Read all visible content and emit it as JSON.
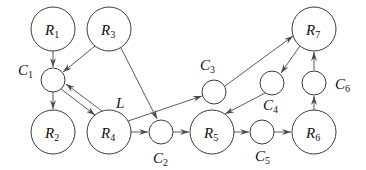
{
  "diagram": {
    "type": "directed-graph",
    "nodes": [
      {
        "id": "R1",
        "letter": "R",
        "sub": "1",
        "kind": "large",
        "x": 53,
        "y": 29
      },
      {
        "id": "R3",
        "letter": "R",
        "sub": "3",
        "kind": "large",
        "x": 109,
        "y": 29
      },
      {
        "id": "C1",
        "letter": "C",
        "sub": "1",
        "kind": "small",
        "x": 53,
        "y": 80
      },
      {
        "id": "R2",
        "letter": "R",
        "sub": "2",
        "kind": "large",
        "x": 53,
        "y": 132
      },
      {
        "id": "R4",
        "letter": "R",
        "sub": "4",
        "kind": "large",
        "x": 109,
        "y": 132
      },
      {
        "id": "C2",
        "letter": "C",
        "sub": "2",
        "kind": "small",
        "x": 161,
        "y": 132
      },
      {
        "id": "R5",
        "letter": "R",
        "sub": "5",
        "kind": "large",
        "x": 212,
        "y": 132
      },
      {
        "id": "C5",
        "letter": "C",
        "sub": "5",
        "kind": "small",
        "x": 262,
        "y": 132
      },
      {
        "id": "R6",
        "letter": "R",
        "sub": "6",
        "kind": "large",
        "x": 314,
        "y": 132
      },
      {
        "id": "C3",
        "letter": "C",
        "sub": "3",
        "kind": "small",
        "x": 214,
        "y": 92
      },
      {
        "id": "C4",
        "letter": "C",
        "sub": "4",
        "kind": "small",
        "x": 272,
        "y": 83
      },
      {
        "id": "C6",
        "letter": "C",
        "sub": "6",
        "kind": "small",
        "x": 315,
        "y": 83
      },
      {
        "id": "R7",
        "letter": "R",
        "sub": "7",
        "kind": "large",
        "x": 314,
        "y": 29
      }
    ],
    "edges": [
      {
        "from": "R1",
        "to": "C1"
      },
      {
        "from": "R3",
        "to": "C1"
      },
      {
        "from": "R3",
        "to": "C2"
      },
      {
        "from": "C1",
        "to": "R2"
      },
      {
        "from": "C1",
        "to": "R4"
      },
      {
        "from": "R4",
        "to": "C1",
        "label": "L"
      },
      {
        "from": "R4",
        "to": "C2"
      },
      {
        "from": "R4",
        "to": "C3"
      },
      {
        "from": "C2",
        "to": "R5"
      },
      {
        "from": "C3",
        "to": "R7"
      },
      {
        "from": "R7",
        "to": "C4"
      },
      {
        "from": "C4",
        "to": "R5"
      },
      {
        "from": "R5",
        "to": "C5"
      },
      {
        "from": "C5",
        "to": "R6"
      },
      {
        "from": "R6",
        "to": "C6"
      },
      {
        "from": "C6",
        "to": "R7"
      }
    ],
    "labels": {
      "R1": {
        "letter": "R",
        "sub": "1"
      },
      "R2": {
        "letter": "R",
        "sub": "2"
      },
      "R3": {
        "letter": "R",
        "sub": "3"
      },
      "R4": {
        "letter": "R",
        "sub": "4"
      },
      "R5": {
        "letter": "R",
        "sub": "5"
      },
      "R6": {
        "letter": "R",
        "sub": "6"
      },
      "R7": {
        "letter": "R",
        "sub": "7"
      },
      "C1": {
        "letter": "C",
        "sub": "1"
      },
      "C2": {
        "letter": "C",
        "sub": "2"
      },
      "C3": {
        "letter": "C",
        "sub": "3"
      },
      "C4": {
        "letter": "C",
        "sub": "4"
      },
      "C5": {
        "letter": "C",
        "sub": "5"
      },
      "C6": {
        "letter": "C",
        "sub": "6"
      },
      "L": "L"
    }
  }
}
